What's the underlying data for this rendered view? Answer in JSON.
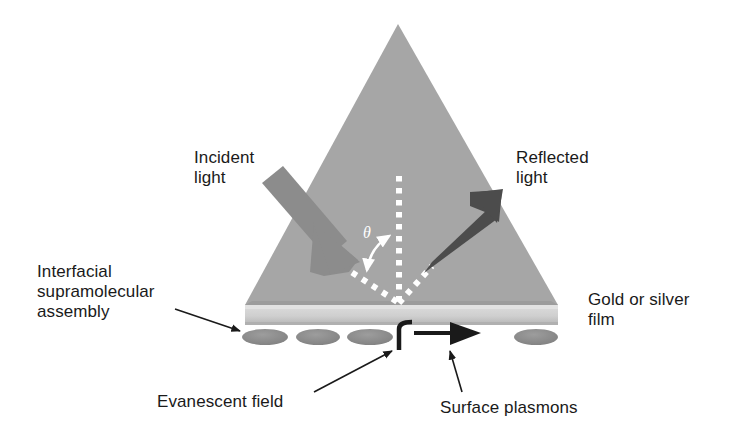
{
  "figure": {
    "kind": "surface-plasmon-resonance-schematic",
    "background": "#ffffff"
  },
  "labels": {
    "incident_light": "Incident\nlight",
    "reflected_light": "Reflected\nlight",
    "interfacial_assembly": "Interfacial\nsupramolecular\nassembly",
    "gold_or_silver_film": "Gold or silver\nfilm",
    "evanescent_field": "Evanescent field",
    "surface_plasmons": "Surface plasmons",
    "angle_symbol": "θ"
  },
  "colors": {
    "prism_fill": "#a6a6a6",
    "prism_edge": "#9a9a9a",
    "film_fill": "#cfcfcf",
    "film_shadow": "#b8b8b8",
    "molecule_fill": "#8e8e8e",
    "incident_arrow": "#8a8a8a",
    "reflected_arrow": "#4a4a4a",
    "plasmon_arrow": "#1a1a1a",
    "dotted_ray": "#ffffff",
    "text": "#1a1a1a",
    "callout_line": "#1a1a1a",
    "page_background": "#ffffff"
  },
  "geometry": {
    "prism": {
      "apex": [
        398,
        24
      ],
      "base_left": [
        245,
        305
      ],
      "base_right": [
        558,
        305
      ],
      "description": "equilateral-ish triangular prism seen edge-on"
    },
    "film": {
      "x": 245,
      "y": 305,
      "width": 313,
      "height": 20,
      "description": "gold or silver thin film slab under the prism base"
    },
    "molecules": [
      {
        "cx": 265,
        "cy": 337,
        "rx": 23,
        "ry": 8
      },
      {
        "cx": 318,
        "cy": 337,
        "rx": 22,
        "ry": 8
      },
      {
        "cx": 370,
        "cy": 337,
        "rx": 23,
        "ry": 8
      },
      {
        "cx": 536,
        "cy": 337,
        "rx": 22,
        "ry": 8
      }
    ],
    "normal_line": {
      "x": 399,
      "y_top": 176,
      "y_bottom": 304,
      "style": "white dotted"
    },
    "incident_ray_dotted": {
      "from": [
        344,
        268
      ],
      "to": [
        399,
        304
      ],
      "style": "white dotted"
    },
    "reflected_ray_dotted": {
      "from": [
        399,
        304
      ],
      "to": [
        430,
        268
      ],
      "style": "white dotted"
    },
    "incident_arrow": {
      "tail": [
        266,
        188
      ],
      "tip": [
        349,
        270
      ],
      "weight": "thick"
    },
    "reflected_arrow": {
      "tail": [
        427,
        270
      ],
      "tip": [
        499,
        194
      ],
      "weight": "medium"
    },
    "angle_arc": {
      "between": "incident ray and surface normal",
      "double_headed": true
    },
    "evanescent_field_glyph": {
      "x": 396,
      "y": 322,
      "shape": "decaying hook curve"
    },
    "plasmon_arrow": {
      "tail": [
        419,
        334
      ],
      "tip": [
        480,
        334
      ],
      "direction": "right"
    }
  },
  "callouts": [
    {
      "name": "interfacial-assembly-callout",
      "from": [
        178,
        311
      ],
      "to": [
        243,
        332
      ]
    },
    {
      "name": "evanescent-field-callout",
      "from": [
        312,
        394
      ],
      "to": [
        392,
        352
      ]
    },
    {
      "name": "surface-plasmons-callout",
      "from": [
        461,
        394
      ],
      "to": [
        449,
        352
      ]
    }
  ]
}
